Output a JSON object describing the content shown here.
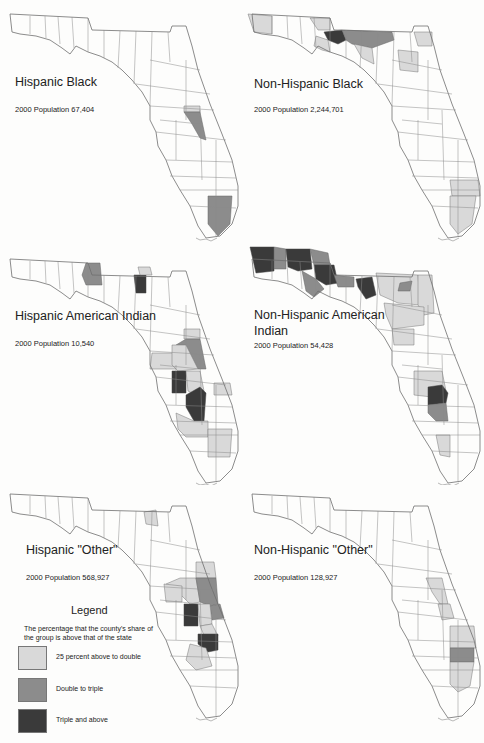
{
  "figure": {
    "colors": {
      "none": "#ffffff",
      "low": "#d9d9d9",
      "mid": "#8c8c8c",
      "high": "#3a3a3a",
      "border": "#6e6e6e"
    },
    "panels": [
      {
        "id": "hispanic-black",
        "title": "Hispanic Black",
        "population": "2000 Population 67,404"
      },
      {
        "id": "non-hispanic-black",
        "title": "Non-Hispanic Black",
        "population": "2000 Population 2,244,701"
      },
      {
        "id": "hispanic-american-indian",
        "title": "Hispanic American Indian",
        "population": "2000 Population 10,540"
      },
      {
        "id": "non-hispanic-american-indian",
        "title": "Non-Hispanic American Indian",
        "title_line1": "Non-Hispanic American",
        "title_line2": "Indian",
        "population": "2000 Population 54,428"
      },
      {
        "id": "hispanic-other",
        "title": "Hispanic \"Other\"",
        "population": "2000 Population 568,927"
      },
      {
        "id": "non-hispanic-other",
        "title": "Non-Hispanic \"Other\"",
        "population": "2000 Population 128,927"
      }
    ],
    "legend": {
      "title": "Legend",
      "description": "The percentage that the county's share of the group is above that of the state",
      "items": [
        {
          "label": "25 percent above to double",
          "color": "#d9d9d9"
        },
        {
          "label": "Double to triple",
          "color": "#8c8c8c"
        },
        {
          "label": "Triple and above",
          "color": "#3a3a3a"
        }
      ]
    }
  }
}
